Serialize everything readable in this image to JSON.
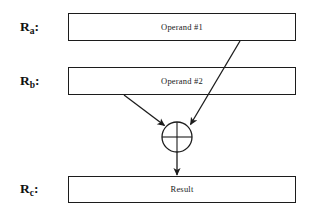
{
  "diagram": {
    "background_color": "#ffffff",
    "stroke_color": "#1c1c1c",
    "labels": {
      "reg_a": {
        "base": "R",
        "subscript": "a",
        "colon": ":",
        "full": "Ra:"
      },
      "reg_b": {
        "base": "R",
        "subscript": "b",
        "colon": ":",
        "full": "Rb:"
      },
      "reg_c": {
        "base": "R",
        "subscript": "c",
        "colon": ":",
        "full": "Rc:"
      }
    },
    "boxes": [
      {
        "id": "operand-1",
        "text": "Operand #1",
        "x": 68,
        "y": 13,
        "width": 228,
        "height": 28
      },
      {
        "id": "operand-2",
        "text": "Operand #2",
        "x": 68,
        "y": 67,
        "width": 228,
        "height": 28
      },
      {
        "id": "result",
        "text": "Result",
        "x": 68,
        "y": 176,
        "width": 228,
        "height": 27
      }
    ],
    "operator": {
      "id": "adder",
      "symbol": "plus-in-circle",
      "center_x": 177,
      "center_y": 137,
      "radius": 15
    },
    "connections": [
      {
        "id": "operand1-to-adder",
        "from": "operand-1",
        "to": "adder",
        "x1": 240,
        "y1": 41,
        "x2": 190,
        "y2": 124
      },
      {
        "id": "operand2-to-adder",
        "from": "operand-2",
        "to": "adder",
        "x1": 124,
        "y1": 95,
        "x2": 165,
        "y2": 126
      },
      {
        "id": "adder-to-result",
        "from": "adder",
        "to": "result",
        "x1": 177,
        "y1": 152,
        "x2": 177,
        "y2": 175
      }
    ]
  }
}
